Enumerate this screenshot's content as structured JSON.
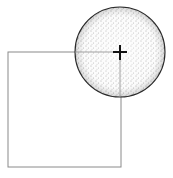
{
  "diagram": {
    "background": "#ffffff",
    "square": {
      "x": 8,
      "y": 52,
      "width": 113,
      "height": 115,
      "stroke": "#8a8a8a"
    },
    "circle": {
      "cx": 120,
      "cy": 52,
      "r": 45,
      "stroke": "#2a2a2a",
      "fill": "stippled"
    },
    "crosshair": {
      "x": 120,
      "y": 52,
      "size": 7,
      "stroke": "#111111"
    }
  }
}
